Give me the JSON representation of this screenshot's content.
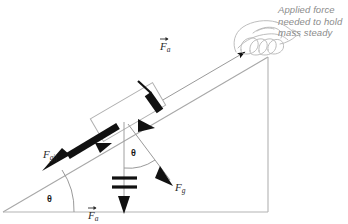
{
  "diagram": {
    "callout": {
      "line1": "Applied force",
      "line2": "needed to hold",
      "line3": "mass steady"
    },
    "labels": {
      "applied_force": {
        "base": "F",
        "sub": "a",
        "vector": true
      },
      "gravity_parallel": {
        "base": "F",
        "sub": "g||",
        "vector": false
      },
      "gravity": {
        "base": "F",
        "sub": "g",
        "vector": false
      },
      "normal_bottom": {
        "base": "F",
        "sub": "a",
        "vector": true
      }
    },
    "angles": {
      "incline_angle": "θ",
      "gravity_angle": "θ"
    },
    "colors": {
      "ink": "#2b2b2b",
      "line": "#a8a8a8",
      "callout_text": "#8b8b8b",
      "arrow_fill": "#111111",
      "background": "#ffffff"
    }
  }
}
